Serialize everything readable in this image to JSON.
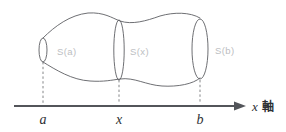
{
  "figure": {
    "background_color": "#ffffff",
    "outline_color": "#5d5f63",
    "axis_color": "#53555a",
    "label_color": "#bcbec2",
    "tick_color": "#2e3034",
    "dash_color": "#76787c"
  },
  "axis": {
    "name_variable": "x",
    "name_suffix": "軸",
    "line_y": 106,
    "x_start": 14,
    "x_end": 238,
    "arrow_label": "arrow-right-icon"
  },
  "ticks": [
    {
      "label": "a",
      "x": 43
    },
    {
      "label": "x",
      "x": 119
    },
    {
      "label": "b",
      "x": 200
    }
  ],
  "cross_sections": [
    {
      "label": "S(a)",
      "cx": 43,
      "rx": 4.0,
      "ry": 12.0,
      "text_x": 57,
      "text_y": 52
    },
    {
      "label": "S(x)",
      "cx": 119,
      "rx": 5.2,
      "ry": 30.0,
      "text_x": 130,
      "text_y": 52
    },
    {
      "label": "S(b)",
      "cx": 200,
      "rx": 8.0,
      "ry": 30.0,
      "text_x": 215,
      "text_y": 51
    }
  ],
  "solid": {
    "top_path": "M 43 38 C 55 26, 70 15, 88 13 C 104 12, 112 18, 120 21 C 132 25, 146 21, 160 16 C 174 12, 190 12, 200 18",
    "bottom_path": "M 43 62 C 56 70, 72 80, 90 81 C 104 82, 112 80, 120 79 C 134 77, 146 85, 162 86 C 178 87, 193 84, 200 78"
  },
  "drop_lines": [
    {
      "x": 43,
      "y_top": 62,
      "y_bottom": 104
    },
    {
      "x": 119,
      "y_top": 80,
      "y_bottom": 104
    },
    {
      "x": 200,
      "y_top": 80,
      "y_bottom": 104
    }
  ]
}
